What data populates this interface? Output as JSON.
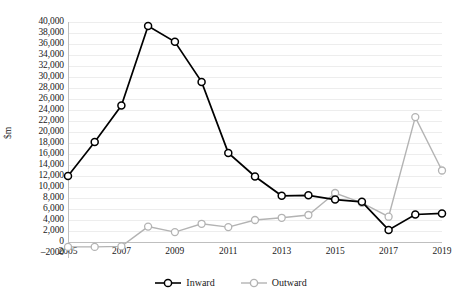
{
  "chart_data": {
    "type": "line",
    "title": "",
    "xlabel": "",
    "ylabel": "$m",
    "x": [
      2005,
      2006,
      2007,
      2008,
      2009,
      2010,
      2011,
      2012,
      2013,
      2014,
      2015,
      2016,
      2017,
      2018,
      2019
    ],
    "xtick_labels": [
      "2005",
      "2007",
      "2009",
      "2011",
      "2013",
      "2015",
      "2017",
      "2019"
    ],
    "xtick_values": [
      2005,
      2007,
      2009,
      2011,
      2013,
      2015,
      2017,
      2019
    ],
    "ytick_labels": [
      "40,000",
      "38,000",
      "36,000",
      "34,000",
      "32,000",
      "30,000",
      "28,000",
      "26,000",
      "24,000",
      "22,000",
      "20,000",
      "18,000",
      "16,000",
      "14,000",
      "12,000",
      "10,000",
      "8,000",
      "6,000",
      "4,000",
      "2,000",
      "0",
      "–2000"
    ],
    "ytick_values": [
      40000,
      38000,
      36000,
      34000,
      32000,
      30000,
      28000,
      26000,
      24000,
      22000,
      20000,
      18000,
      16000,
      14000,
      12000,
      10000,
      8000,
      6000,
      4000,
      2000,
      0,
      -2000
    ],
    "ylim": [
      -2000,
      40000
    ],
    "xlim": [
      2005,
      2019
    ],
    "grid": true,
    "legend_position": "bottom",
    "series": [
      {
        "name": "Inward",
        "color": "#000000",
        "marker": "open-circle",
        "values": [
          12000,
          18200,
          24800,
          39300,
          36400,
          29100,
          16200,
          11900,
          8400,
          8500,
          7700,
          7300,
          2200,
          5000,
          5200
        ]
      },
      {
        "name": "Outward",
        "color": "#b3b3b3",
        "marker": "open-circle",
        "values": [
          -900,
          -900,
          -800,
          2800,
          1800,
          3300,
          2700,
          4000,
          4400,
          4900,
          8900,
          7100,
          4600,
          22700,
          13000
        ]
      }
    ]
  },
  "legend": {
    "items": [
      {
        "label": "Inward"
      },
      {
        "label": "Outward"
      }
    ]
  },
  "colors": {
    "inward": "#000000",
    "outward": "#b3b3b3",
    "gridline": "#ededed",
    "axis": "#bfbfbf",
    "text": "#1a1a1a"
  }
}
